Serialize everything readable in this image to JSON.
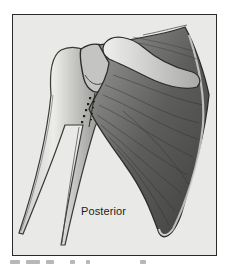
{
  "figure": {
    "view_label": "Posterior",
    "caption_visible": false
  },
  "colors": {
    "frame_border": "#2a2a2a",
    "background": "#e9e9e7",
    "ink_dark": "#2b2b2b",
    "ink_mid": "#6e6e6e",
    "ink_light": "#b5b5b3",
    "bone_fill": "#dcdcda"
  }
}
